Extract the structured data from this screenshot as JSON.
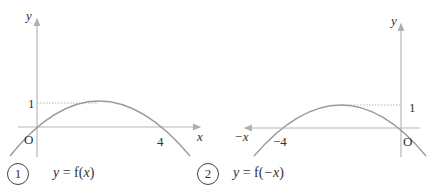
{
  "panels": [
    {
      "number": "1",
      "equation_prefix": "y",
      "equation_eq": " = f(",
      "equation_arg": "x",
      "equation_close": ")",
      "axis_x_label": "x",
      "axis_y_label": "y",
      "origin_label": "O",
      "root_label": "4",
      "max_label": "1"
    },
    {
      "number": "2",
      "equation_prefix": "y",
      "equation_eq": " = f(",
      "equation_arg": "−x",
      "equation_close": ")",
      "axis_x_label": "−x",
      "axis_y_label": "y",
      "origin_label": "O",
      "root_label": "−4",
      "max_label": "1"
    }
  ],
  "colors": {
    "axis": "#b0b0b0",
    "curve": "#9a9a9a",
    "text": "#333333",
    "guide": "#b8b8b8"
  }
}
